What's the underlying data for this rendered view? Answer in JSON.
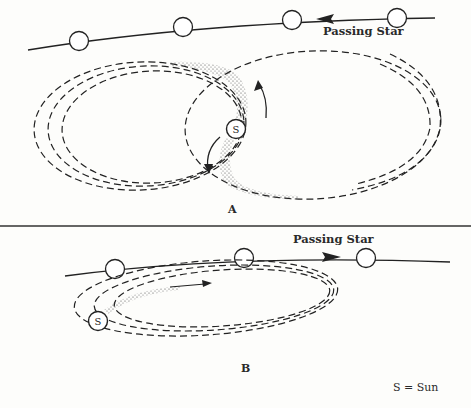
{
  "diagram": {
    "panels": [
      {
        "id": "A",
        "label": "A",
        "star_label": "Passing Star",
        "star_direction": "right-to-left",
        "description": "Passing star draws two opposite tidal streams of material from the Sun forming elongated orbits on both sides"
      },
      {
        "id": "B",
        "label": "B",
        "star_label": "Passing Star",
        "star_direction": "left-to-right",
        "description": "Passing star draws a single stream of material from the Sun into elongated orbits"
      }
    ],
    "sun_symbol": "S",
    "legend": "S = Sun",
    "colors": {
      "ink": "#222222",
      "background": "#fdfdfb"
    }
  }
}
